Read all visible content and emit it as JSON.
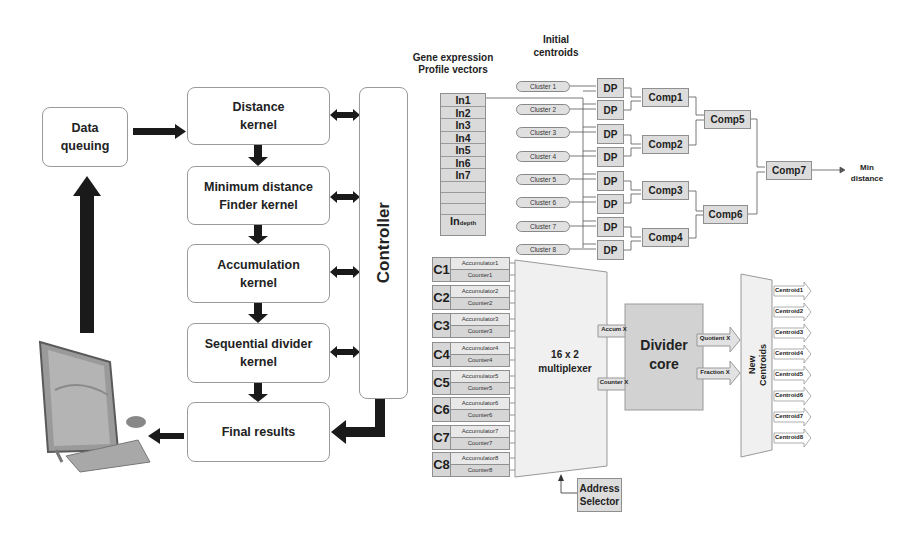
{
  "left_flow": {
    "data_queuing": "Data\nqueuing",
    "distance_kernel": "Distance\nkernel",
    "min_distance_kernel": "Minimum distance\nFinder kernel",
    "accumulation_kernel": "Accumulation\nkernel",
    "divider_kernel": "Sequential divider\nkernel",
    "final_results": "Final results",
    "controller": "Controller",
    "computer_icon": "computer-icon"
  },
  "distance_unit": {
    "input_title": "Gene expression\nProfile vectors",
    "centroid_title": "Initial\ncentroids",
    "inputs": [
      "In1",
      "In2",
      "In3",
      "In4",
      "In5",
      "In6",
      "In7",
      "",
      "",
      "",
      ""
    ],
    "input_depth_main": "In",
    "input_depth_sub": "depth",
    "clusters": [
      "Cluster 1",
      "Cluster 2",
      "Cluster 3",
      "Cluster 4",
      "Cluster 5",
      "Cluster 6",
      "Cluster 7",
      "Cluster 8"
    ],
    "dp_label": "DP",
    "comparators": [
      "Comp1",
      "Comp2",
      "Comp3",
      "Comp4",
      "Comp5",
      "Comp6",
      "Comp7"
    ],
    "output_label": "Min\ndistance"
  },
  "divider_unit": {
    "channels": [
      {
        "id": "C1",
        "acc": "Accumulator1",
        "cnt": "Counter1"
      },
      {
        "id": "C2",
        "acc": "Accumulator2",
        "cnt": "Counter2"
      },
      {
        "id": "C3",
        "acc": "Accumulator3",
        "cnt": "Counter3"
      },
      {
        "id": "C4",
        "acc": "Accumulator4",
        "cnt": "Counter4"
      },
      {
        "id": "C5",
        "acc": "Accumulator5",
        "cnt": "Counter5"
      },
      {
        "id": "C6",
        "acc": "Accumulator6",
        "cnt": "Counter6"
      },
      {
        "id": "C7",
        "acc": "Accumulator7",
        "cnt": "Counter7"
      },
      {
        "id": "C8",
        "acc": "Accumulator8",
        "cnt": "Counter8"
      }
    ],
    "mux_label": "16 x 2\nmultiplexer",
    "address_selector": "Address\nSelector",
    "accum_x": "Accum X",
    "counter_x": "Counter X",
    "divider_core": "Divider\ncore",
    "quotient_x": "Quotient X",
    "fraction_x": "Fraction X",
    "new_centroids": "New\nCentroids",
    "centroids": [
      "Centroid1",
      "Centroid2",
      "Centroid3",
      "Centroid4",
      "Centroid5",
      "Centroid6",
      "Centroid7",
      "Centroid8"
    ]
  },
  "colors": {
    "box_fill": "#dcdcdc",
    "border": "#8f8f8f",
    "arrow": "#1a1a1a"
  }
}
